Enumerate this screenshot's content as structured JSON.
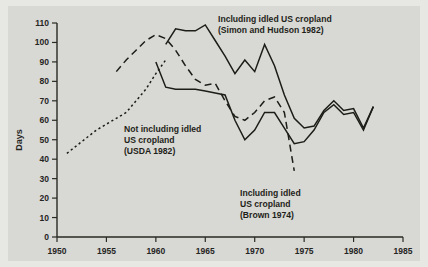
{
  "chart_data": {
    "type": "line",
    "title": "",
    "xlabel": "",
    "ylabel": "Days",
    "xlim": [
      1950,
      1985
    ],
    "ylim": [
      0,
      110
    ],
    "xticks": [
      1950,
      1955,
      1960,
      1965,
      1970,
      1975,
      1980,
      1985
    ],
    "xtick_labels": [
      "1950",
      "1955",
      "1960",
      "1965",
      "1970",
      "1975",
      "1980",
      "1985"
    ],
    "yticks": [
      0,
      10,
      20,
      30,
      40,
      50,
      60,
      70,
      80,
      90,
      100,
      110
    ],
    "ytick_labels": [
      "0",
      "10",
      "20",
      "30",
      "40",
      "50",
      "60",
      "70",
      "80",
      "90",
      "100",
      "110"
    ],
    "grid": false,
    "legend_position": "annotations-inline",
    "series": [
      {
        "name": "Including idled US cropland (Simon and Hudson 1982)",
        "style": "solid",
        "x": [
          1961,
          1962,
          1963,
          1964,
          1965,
          1966,
          1967,
          1968,
          1969,
          1970,
          1971,
          1972,
          1973,
          1974,
          1975,
          1976,
          1977,
          1978,
          1979,
          1980,
          1981,
          1982
        ],
        "y": [
          99,
          107,
          106,
          106,
          109,
          101,
          93,
          84,
          91,
          85,
          99,
          88,
          73,
          61,
          56,
          57,
          65,
          70,
          65,
          66,
          56,
          67
        ]
      },
      {
        "name": "Not including idled US cropland (USDA 1982)",
        "style": "solid",
        "x": [
          1960,
          1961,
          1962,
          1963,
          1964,
          1965,
          1966,
          1967,
          1968,
          1969,
          1970,
          1971,
          1972,
          1973,
          1974,
          1975,
          1976,
          1977,
          1978,
          1979,
          1980,
          1981,
          1982
        ],
        "y": [
          90,
          77,
          76,
          76,
          76,
          75,
          74,
          73,
          60,
          50,
          55,
          64,
          64,
          56,
          48,
          49,
          55,
          64,
          68,
          63,
          64,
          55,
          67
        ]
      },
      {
        "name": "Including idled US cropland (Brown 1974)",
        "style": "dashed",
        "x": [
          1956,
          1957,
          1958,
          1959,
          1960,
          1961,
          1962,
          1963,
          1964,
          1965,
          1966,
          1967,
          1968,
          1969,
          1970,
          1971,
          1972,
          1973,
          1974
        ],
        "y": [
          85,
          91,
          96,
          101,
          104,
          102,
          96,
          88,
          81,
          78,
          79,
          70,
          62,
          60,
          64,
          70,
          72,
          64,
          34
        ]
      },
      {
        "name": "Early series (dotted lead-in)",
        "style": "dotted",
        "x": [
          1951,
          1952,
          1953,
          1954,
          1955,
          1956,
          1957,
          1958,
          1959,
          1960,
          1961
        ],
        "y": [
          43,
          47,
          51,
          55,
          58,
          61,
          64,
          70,
          76,
          84,
          91
        ]
      }
    ],
    "annotations": [
      {
        "id": "anno-simon-hudson",
        "lines": [
          "Including idled US cropland",
          "(Simon and Hudson 1982)"
        ],
        "x_px": 218,
        "y_px": 22
      },
      {
        "id": "anno-usda",
        "lines": [
          "Not including idled",
          "US cropland",
          "(USDA 1982)"
        ],
        "x_px": 124,
        "y_px": 132
      },
      {
        "id": "anno-brown",
        "lines": [
          "Including idled",
          "US cropland",
          "(Brown 1974)"
        ],
        "x_px": 240,
        "y_px": 196
      }
    ],
    "colors": {
      "background": "#d8d8d4",
      "outer_background": "#e7e7e4",
      "line": "#1d1d18",
      "axis": "#2a2a24",
      "text": "#1f1f1a"
    }
  }
}
